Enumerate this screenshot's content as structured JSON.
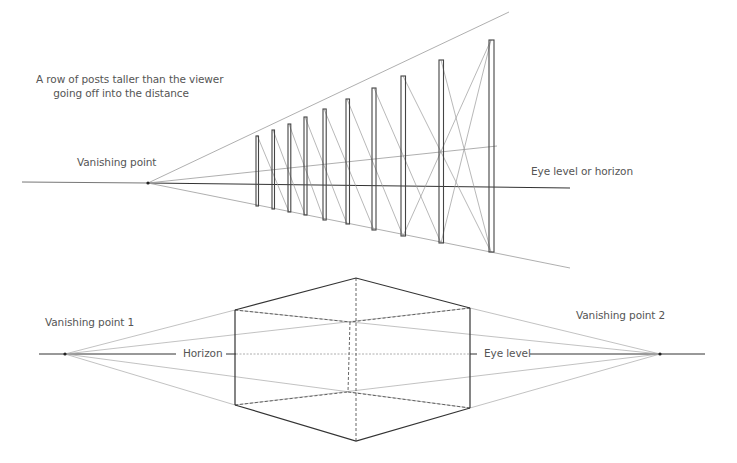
{
  "one_point": {
    "caption_line1": "A row of posts taller than the viewer",
    "caption_line2": "going off into the distance",
    "vanishing_point_label": "Vanishing point",
    "horizon_label": "Eye level or horizon",
    "vanishing_point": [
      148,
      183
    ],
    "post_count": 10,
    "colors": {
      "post": "#444444",
      "guide": "#9a9a9a",
      "horizon": "#333333"
    }
  },
  "two_point": {
    "vp1_label": "Vanishing point 1",
    "vp2_label": "Vanishing point 2",
    "horizon_label": "Horizon",
    "eye_level_label": "Eye level",
    "vanishing_point_1": [
      65,
      354
    ],
    "vanishing_point_2": [
      660,
      354
    ],
    "colors": {
      "edge": "#333333",
      "hidden": "#666666",
      "guide": "#a0a0a0"
    }
  }
}
